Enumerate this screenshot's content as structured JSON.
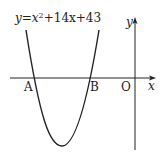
{
  "diagram": {
    "type": "parabola-graph",
    "equation": {
      "prefix": "y=x",
      "exponent": "2",
      "suffix": "+14x+43"
    },
    "labels": {
      "A": "A",
      "B": "B",
      "origin": "O",
      "x_axis": "x",
      "y_axis": "y"
    },
    "colors": {
      "stroke": "#222222",
      "background": "#ffffff"
    }
  }
}
